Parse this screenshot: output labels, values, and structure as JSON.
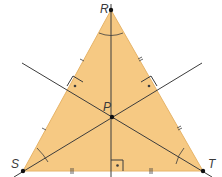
{
  "diagram": {
    "type": "triangle-with-perpendicular-bisectors",
    "fill_color": "#f6c983",
    "edge_color": "#e7b468",
    "line_color": "#3c3c3c",
    "points": {
      "R": {
        "label": "R",
        "x": 111,
        "y": 10
      },
      "S": {
        "label": "S",
        "x": 23,
        "y": 171
      },
      "T": {
        "label": "T",
        "x": 203,
        "y": 171
      },
      "P": {
        "label": "P",
        "x": 112,
        "y": 117
      }
    },
    "labels": {
      "R": "R",
      "S": "S",
      "T": "T",
      "P": "P"
    }
  }
}
